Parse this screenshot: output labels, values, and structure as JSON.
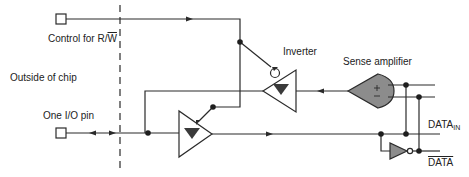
{
  "diagram": {
    "labels": {
      "control": "Control for R/",
      "control_bar": "W",
      "inverter": "Inverter",
      "sense_amp": "Sense amplifier",
      "outside": "Outside of chip",
      "io_pin": "One I/O pin",
      "data_in": "DATA",
      "data_in_sub": "IN",
      "data_bar": "DATA"
    },
    "colors": {
      "line": "#2a2a2a",
      "amp_fill": "#8c8c8c",
      "tri_fill": "#3a3a3a",
      "background": "#ffffff"
    },
    "components": [
      {
        "id": "control-pad",
        "type": "pin"
      },
      {
        "id": "io-pad",
        "type": "pin"
      },
      {
        "id": "chip-boundary",
        "type": "dashed-line"
      },
      {
        "id": "inverter",
        "type": "tristate-buffer-inverting-enable",
        "direction": "left"
      },
      {
        "id": "output-buffer",
        "type": "tristate-buffer",
        "direction": "right"
      },
      {
        "id": "sense-amplifier",
        "type": "differential-amplifier",
        "direction": "left"
      },
      {
        "id": "data-inverter",
        "type": "inverter",
        "direction": "right"
      }
    ]
  }
}
